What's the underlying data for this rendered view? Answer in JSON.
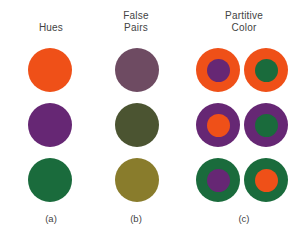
{
  "figure": {
    "palette": {
      "orange": "#EF5018",
      "purple": "#662774",
      "green": "#1A6B3C",
      "false_mauve": "#6E4B62",
      "false_olive_dark": "#4B5431",
      "false_olive_gold": "#897C2C",
      "background": "#FFFFFF",
      "text": "#434343"
    },
    "columns": [
      {
        "key": "a",
        "heading": "Hues",
        "caption": "(a)",
        "swatches": [
          {
            "name": "orange-hue-swatch",
            "fill": "#EF5018"
          },
          {
            "name": "purple-hue-swatch",
            "fill": "#662774"
          },
          {
            "name": "green-hue-swatch",
            "fill": "#1A6B3C"
          }
        ]
      },
      {
        "key": "b",
        "heading": "False\nPairs",
        "caption": "(b)",
        "swatches": [
          {
            "name": "mauve-false-pair-swatch",
            "fill": "#6E4B62"
          },
          {
            "name": "dark-olive-false-pair-swatch",
            "fill": "#4B5431"
          },
          {
            "name": "gold-olive-false-pair-swatch",
            "fill": "#897C2C"
          }
        ]
      },
      {
        "key": "c",
        "heading": "Partitive\nColor",
        "caption": "(c)",
        "pairs": [
          {
            "name": "orange-ring-pair",
            "ring": "#EF5018",
            "left_core": "#662774",
            "right_core": "#1A6B3C"
          },
          {
            "name": "purple-ring-pair",
            "ring": "#662774",
            "left_core": "#EF5018",
            "right_core": "#1A6B3C"
          },
          {
            "name": "green-ring-pair",
            "ring": "#1A6B3C",
            "left_core": "#662774",
            "right_core": "#EF5018"
          }
        ]
      }
    ]
  }
}
